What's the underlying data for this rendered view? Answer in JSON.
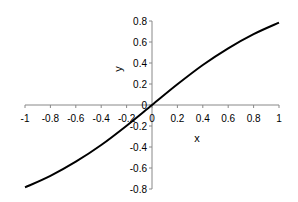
{
  "chart_data": {
    "type": "line",
    "title": "",
    "xlabel": "x",
    "ylabel": "y",
    "xlim": [
      -1,
      1
    ],
    "ylim": [
      -0.8,
      0.8
    ],
    "grid": false,
    "legend": null,
    "x_ticks": [
      "-1",
      "-0.8",
      "-0.6",
      "-0.4",
      "-0.2",
      "0",
      "0.2",
      "0.4",
      "0.6",
      "0.8",
      "1"
    ],
    "y_ticks": [
      "-0.8",
      "-0.6",
      "-0.4",
      "-0.2",
      "0",
      "0.2",
      "0.4",
      "0.6",
      "0.8"
    ],
    "series": [
      {
        "name": "y",
        "color": "#000000",
        "x": [
          -1,
          -0.8,
          -0.6,
          -0.4,
          -0.2,
          0,
          0.2,
          0.4,
          0.6,
          0.8,
          1
        ],
        "values": [
          -0.785,
          -0.675,
          -0.54,
          -0.381,
          -0.197,
          0,
          0.197,
          0.381,
          0.54,
          0.675,
          0.785
        ]
      }
    ]
  }
}
